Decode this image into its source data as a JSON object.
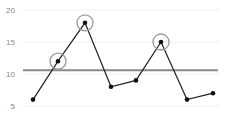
{
  "chart_data": {
    "type": "line",
    "title": "",
    "xlabel": "",
    "ylabel": "",
    "x": [
      1,
      2,
      3,
      4,
      5,
      6,
      7,
      8
    ],
    "series": [
      {
        "name": "values",
        "values": [
          6,
          12,
          18,
          8,
          9,
          15,
          6,
          7
        ]
      }
    ],
    "highlighted_points": [
      1,
      2,
      5
    ],
    "reference_line": {
      "value": 10.6
    },
    "yticks": [
      5,
      10,
      15,
      20
    ],
    "ylim": [
      3.5,
      21.5
    ],
    "grid": true,
    "legend": null
  },
  "colors": {
    "line": "#222222",
    "point": "#111111",
    "highlight_ring": "#999999",
    "reference": "#888888",
    "grid": "#eeeeee",
    "tick_label": "#888888"
  }
}
